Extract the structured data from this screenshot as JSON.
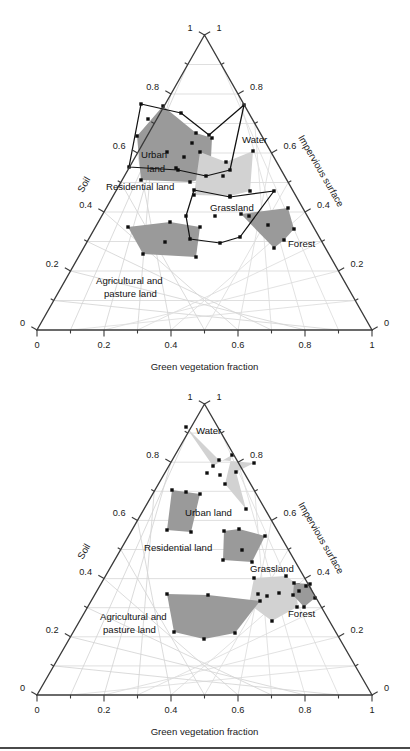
{
  "figure": {
    "name": "ternary-mixture-diagrams",
    "panel_count": 2,
    "has_bottom_rule": true
  },
  "colors": {
    "dark_fill": "#9a9a9a",
    "light_fill": "#d2d2d2",
    "outline": "#111111",
    "axis": "#3a3a3a",
    "grid": "#d9d9d9",
    "point": "#0d0d0d"
  },
  "axes": {
    "bottom_label": "Green vegetation fraction",
    "left_label": "Soil",
    "right_label": "Impervious surface",
    "bottom_ticks": [
      "0",
      "0.2",
      "0.4",
      "0.6",
      "0.8",
      "1"
    ],
    "bottom_tick_values": [
      0,
      0.2,
      0.4,
      0.6,
      0.8,
      1
    ],
    "left_ticks": [
      "1",
      "0.8",
      "0.6",
      "0.4",
      "0.2",
      "0"
    ],
    "left_tick_values": [
      1,
      0.8,
      0.6,
      0.4,
      0.2,
      0
    ],
    "right_ticks": [
      "0",
      "0.2",
      "0.4",
      "0.6",
      "0.8",
      "1"
    ],
    "right_tick_values": [
      0,
      0.2,
      0.4,
      0.6,
      0.8,
      1
    ],
    "minor_tick_step": 0.1
  },
  "classes": [
    {
      "key": "water",
      "label": "Water"
    },
    {
      "key": "urban_land",
      "label": "Urban land"
    },
    {
      "key": "urban_land_l1",
      "label": "Urban"
    },
    {
      "key": "urban_land_l2",
      "label": "land"
    },
    {
      "key": "residential_land",
      "label": "Residential land"
    },
    {
      "key": "grassland",
      "label": "Grassland"
    },
    {
      "key": "forest",
      "label": "Forest"
    },
    {
      "key": "agricultural",
      "label": "Agricultural and"
    },
    {
      "key": "agricultural_l2",
      "label": "pasture land"
    }
  ],
  "chart_data": [
    {
      "type": "scatter",
      "panel": "top",
      "title": "",
      "xlabel": "Green vegetation fraction",
      "ylabel": "Soil",
      "zlabel": "Impervious surface",
      "ternary": true,
      "axis_range": [
        0,
        1
      ],
      "grid": true,
      "series": [
        {
          "name": "Urban land",
          "style": "dark-filled",
          "polygon_px": [
            [
              163,
              106
            ],
            [
              137,
              136
            ],
            [
              141,
              180
            ],
            [
              190,
              182
            ],
            [
              210,
              177
            ],
            [
              212,
              138
            ],
            [
              196,
              133
            ]
          ],
          "points_px": [
            [
              163,
              106
            ],
            [
              137,
              136
            ],
            [
              141,
              180
            ],
            [
              190,
              182
            ],
            [
              210,
              177
            ],
            [
              212,
              138
            ],
            [
              196,
              133
            ],
            [
              167,
              152
            ],
            [
              184,
              157
            ],
            [
              192,
              143
            ],
            [
              176,
              168
            ],
            [
              148,
              119
            ]
          ]
        },
        {
          "name": "Water",
          "style": "open-outline",
          "polygon_px": [
            [
              141,
              104
            ],
            [
              129,
              167
            ],
            [
              178,
              170
            ],
            [
              206,
              176
            ],
            [
              230,
              170
            ],
            [
              244,
              105
            ],
            [
              209,
              135
            ],
            [
              181,
              113
            ]
          ],
          "points_px": [
            [
              141,
              104
            ],
            [
              129,
              167
            ],
            [
              178,
              170
            ],
            [
              206,
              176
            ],
            [
              230,
              170
            ],
            [
              244,
              105
            ],
            [
              209,
              135
            ],
            [
              181,
              113
            ]
          ]
        },
        {
          "name": "Residential land",
          "style": "light-filled",
          "polygon_px": [
            [
              200,
              152
            ],
            [
              194,
              195
            ],
            [
              230,
              196
            ],
            [
              250,
              191
            ],
            [
              253,
              151
            ],
            [
              226,
              162
            ]
          ],
          "points_px": [
            [
              200,
              152
            ],
            [
              194,
              195
            ],
            [
              230,
              196
            ],
            [
              250,
              191
            ],
            [
              253,
              151
            ],
            [
              226,
              162
            ],
            [
              223,
              176
            ]
          ]
        },
        {
          "name": "Grassland",
          "style": "open-outline",
          "polygon_px": [
            [
              194,
              190
            ],
            [
              186,
              216
            ],
            [
              190,
              239
            ],
            [
              220,
              243
            ],
            [
              240,
              237
            ],
            [
              274,
              191
            ],
            [
              230,
              197
            ]
          ],
          "points_px": [
            [
              194,
              190
            ],
            [
              186,
              216
            ],
            [
              190,
              239
            ],
            [
              220,
              243
            ],
            [
              240,
              237
            ],
            [
              274,
              191
            ],
            [
              230,
              197
            ],
            [
              215,
              216
            ]
          ]
        },
        {
          "name": "Forest",
          "style": "dark-filled",
          "polygon_px": [
            [
              241,
              214
            ],
            [
              274,
              248
            ],
            [
              284,
              240
            ],
            [
              294,
              229
            ],
            [
              288,
              208
            ]
          ],
          "points_px": [
            [
              241,
              214
            ],
            [
              274,
              248
            ],
            [
              284,
              240
            ],
            [
              294,
              229
            ],
            [
              288,
              208
            ],
            [
              268,
              225
            ],
            [
              249,
              216
            ]
          ]
        },
        {
          "name": "Agricultural and pasture land",
          "style": "dark-filled",
          "polygon_px": [
            [
              128,
              227
            ],
            [
              143,
              254
            ],
            [
              196,
              257
            ],
            [
              200,
              227
            ],
            [
              170,
              222
            ]
          ],
          "points_px": [
            [
              128,
              227
            ],
            [
              143,
              254
            ],
            [
              196,
              257
            ],
            [
              200,
              227
            ],
            [
              170,
              222
            ],
            [
              165,
              242
            ]
          ]
        }
      ]
    },
    {
      "type": "scatter",
      "panel": "bottom",
      "title": "",
      "xlabel": "Green vegetation fraction",
      "ylabel": "Soil",
      "zlabel": "Impervious surface",
      "ternary": true,
      "axis_range": [
        0,
        1
      ],
      "grid": true,
      "series": [
        {
          "name": "Water",
          "style": "light-filled",
          "polygon_px": [
            [
              186,
              427
            ],
            [
              213,
              466
            ],
            [
              232,
              455
            ],
            [
              225,
              484
            ],
            [
              246,
              509
            ],
            [
              236,
              472
            ],
            [
              254,
              463
            ],
            [
              219,
              460
            ]
          ],
          "points_px": [
            [
              186,
              427
            ],
            [
              213,
              466
            ],
            [
              232,
              455
            ],
            [
              225,
              484
            ],
            [
              246,
              509
            ],
            [
              236,
              472
            ],
            [
              254,
              463
            ],
            [
              219,
              460
            ],
            [
              207,
              473
            ],
            [
              220,
              475
            ]
          ]
        },
        {
          "name": "Urban land",
          "style": "dark-filled",
          "polygon_px": [
            [
              172,
              490
            ],
            [
              167,
              530
            ],
            [
              191,
              532
            ],
            [
              200,
              494
            ],
            [
              186,
              492
            ]
          ],
          "points_px": [
            [
              172,
              490
            ],
            [
              167,
              530
            ],
            [
              191,
              532
            ],
            [
              200,
              494
            ],
            [
              186,
              492
            ]
          ]
        },
        {
          "name": "Residential land",
          "style": "dark-filled",
          "polygon_px": [
            [
              224,
              531
            ],
            [
              223,
              560
            ],
            [
              252,
              562
            ],
            [
              265,
              536
            ],
            [
              239,
              529
            ]
          ],
          "points_px": [
            [
              224,
              531
            ],
            [
              223,
              560
            ],
            [
              252,
              562
            ],
            [
              265,
              536
            ],
            [
              239,
              529
            ],
            [
              242,
              550
            ]
          ]
        },
        {
          "name": "Grassland",
          "style": "light-filled",
          "polygon_px": [
            [
              254,
              578
            ],
            [
              249,
              604
            ],
            [
              272,
              621
            ],
            [
              297,
              607
            ],
            [
              298,
              585
            ],
            [
              286,
              576
            ]
          ],
          "points_px": [
            [
              254,
              578
            ],
            [
              249,
              604
            ],
            [
              272,
              621
            ],
            [
              297,
              607
            ],
            [
              298,
              585
            ],
            [
              286,
              576
            ],
            [
              267,
              596
            ],
            [
              258,
              594
            ],
            [
              279,
              593
            ]
          ]
        },
        {
          "name": "Forest",
          "style": "dark-filled",
          "polygon_px": [
            [
              294,
              583
            ],
            [
              293,
              595
            ],
            [
              304,
              607
            ],
            [
              315,
              598
            ],
            [
              310,
              584
            ]
          ],
          "points_px": [
            [
              294,
              583
            ],
            [
              293,
              595
            ],
            [
              304,
              607
            ],
            [
              315,
              598
            ],
            [
              310,
              584
            ],
            [
              299,
              591
            ],
            [
              306,
              586
            ]
          ]
        },
        {
          "name": "Agricultural and pasture land",
          "style": "dark-filled",
          "polygon_px": [
            [
              167,
              594
            ],
            [
              174,
              632
            ],
            [
              204,
              639
            ],
            [
              235,
              633
            ],
            [
              260,
              601
            ],
            [
              208,
              595
            ]
          ],
          "points_px": [
            [
              167,
              594
            ],
            [
              174,
              632
            ],
            [
              204,
              639
            ],
            [
              235,
              633
            ],
            [
              260,
              601
            ],
            [
              208,
              595
            ]
          ]
        }
      ]
    }
  ]
}
